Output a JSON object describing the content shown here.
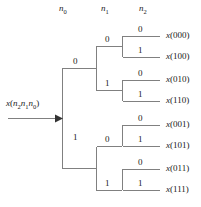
{
  "figure": {
    "type": "binary-decision-tree",
    "title": "",
    "input_label": {
      "fn": "x",
      "args": [
        "n",
        "2",
        "n",
        "1",
        "n",
        "0"
      ],
      "text": "x(n2n1n0)"
    },
    "headers": [
      {
        "base": "n",
        "sub": "0",
        "text": "n0"
      },
      {
        "base": "n",
        "sub": "1",
        "text": "n1"
      },
      {
        "base": "n",
        "sub": "2",
        "text": "n2"
      }
    ],
    "level1_bits": [
      "0",
      "1"
    ],
    "level2_bits": [
      "0",
      "1",
      "0",
      "1"
    ],
    "level3_bits": [
      "0",
      "1",
      "0",
      "1",
      "0",
      "1",
      "0",
      "1"
    ],
    "outputs": [
      "x(000)",
      "x(100)",
      "x(010)",
      "x(110)",
      "x(001)",
      "x(101)",
      "x(011)",
      "x(111)"
    ],
    "arrow": "right-arrow",
    "colors": {
      "line": "#808080",
      "text": "#1a1a1a",
      "background": "#ffffff"
    }
  }
}
